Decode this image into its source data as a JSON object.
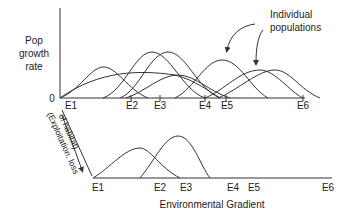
{
  "diagram": {
    "y_axis_label": [
      "Pop",
      "growth",
      "rate"
    ],
    "zero_label": "0",
    "annotation": [
      "Individual",
      "populations"
    ],
    "top_ticks": [
      "E1",
      "E2",
      "E3",
      "E4",
      "E5",
      "E6"
    ],
    "bottom_ticks": [
      "E1",
      "E2",
      "E3",
      "E4",
      "E5",
      "E6"
    ],
    "side_label": [
      "(Exploitation, loss",
      "of habitat)"
    ],
    "x_axis_label": "Environmental Gradient",
    "line_color": "#333333"
  }
}
